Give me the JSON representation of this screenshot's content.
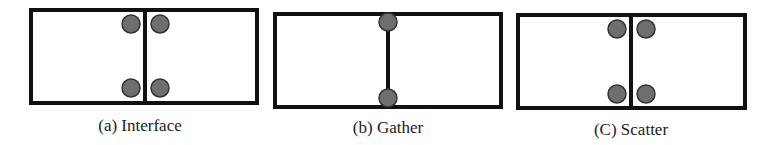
{
  "figure": {
    "stroke_color": "#111111",
    "node_fill": "#6e6e6e",
    "node_stroke": "#333333",
    "panels": [
      {
        "id": "a",
        "caption": "(a) Interface",
        "box": {
          "x": 31,
          "y": 10,
          "w": 226,
          "h": 93
        },
        "divider_x": 145,
        "nodes": [
          {
            "cx": 131,
            "cy": 24
          },
          {
            "cx": 160,
            "cy": 24
          },
          {
            "cx": 131,
            "cy": 88
          },
          {
            "cx": 160,
            "cy": 88
          }
        ],
        "caption_x": 140,
        "caption_y": 117
      },
      {
        "id": "b",
        "caption": "(b) Gather",
        "box": {
          "x": 275,
          "y": 14,
          "w": 226,
          "h": 93
        },
        "divider_x": 388,
        "nodes": [
          {
            "cx": 388,
            "cy": 22
          },
          {
            "cx": 388,
            "cy": 98
          }
        ],
        "caption_x": 388,
        "caption_y": 119
      },
      {
        "id": "c",
        "caption": "(C) Scatter",
        "box": {
          "x": 518,
          "y": 15,
          "w": 227,
          "h": 93
        },
        "divider_x": 631,
        "nodes": [
          {
            "cx": 617,
            "cy": 29
          },
          {
            "cx": 646,
            "cy": 29
          },
          {
            "cx": 617,
            "cy": 94
          },
          {
            "cx": 646,
            "cy": 94
          }
        ],
        "caption_x": 631,
        "caption_y": 121
      }
    ]
  }
}
